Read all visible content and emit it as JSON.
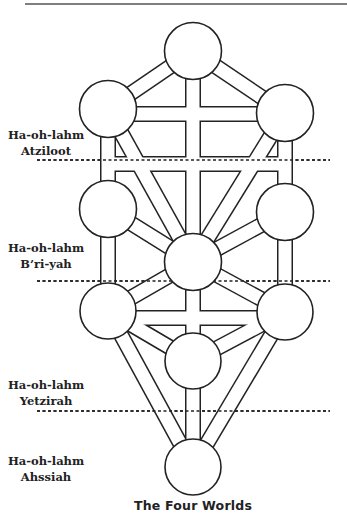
{
  "caption": "The Four Worlds",
  "worlds": [
    {
      "line1": "Ha-oh-lahm",
      "line2": "Atziloot"
    },
    {
      "line1": "Ha-oh-lahm",
      "line2": "B’ri-yah"
    },
    {
      "line1": "Ha-oh-lahm",
      "line2": "Yetzirah"
    },
    {
      "line1": "Ha-oh-lahm",
      "line2": "Ahssiah"
    }
  ],
  "diagram": {
    "type": "tree-of-life",
    "node_count": 10,
    "colors": {
      "stroke": "#222222",
      "fill": "#ffffff"
    }
  }
}
